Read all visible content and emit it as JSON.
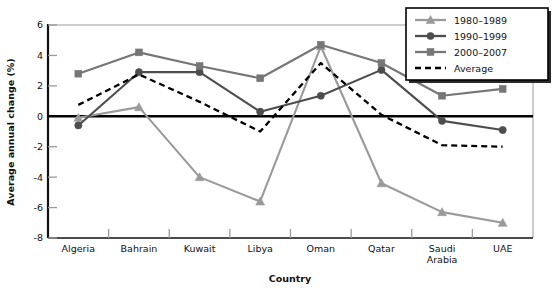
{
  "chart_data": {
    "type": "line",
    "title": "",
    "xlabel": "Country",
    "ylabel": "Average annual change (%)",
    "categories": [
      "Algeria",
      "Bahrain",
      "Kuwait",
      "Libya",
      "Oman",
      "Qatar",
      "Saudi Arabia",
      "UAE"
    ],
    "category_labels_multiline": [
      [
        "Algeria"
      ],
      [
        "Bahrain"
      ],
      [
        "Kuwait"
      ],
      [
        "Libya"
      ],
      [
        "Oman"
      ],
      [
        "Qatar"
      ],
      [
        "Saudi",
        "Arabia"
      ],
      [
        "UAE"
      ]
    ],
    "ylim": [
      -8,
      6
    ],
    "yticks": [
      6,
      4,
      2,
      0,
      -2,
      -4,
      -6,
      -8
    ],
    "ytick_labels": [
      "6",
      "4",
      "2",
      "0",
      "-2",
      "-4",
      "-6",
      "-8"
    ],
    "grid": false,
    "zero_line": true,
    "legend_position": "top-right",
    "series": [
      {
        "name": "1980-1989",
        "label": "1980–1989",
        "marker": "triangle",
        "color": "#9a9a9a",
        "dash": false,
        "values": [
          -0.1,
          0.6,
          -4.0,
          -5.6,
          4.6,
          -4.4,
          -6.3,
          -7.0
        ]
      },
      {
        "name": "1990-1999",
        "label": "1990–1999",
        "marker": "circle",
        "color": "#4d4d4d",
        "dash": false,
        "values": [
          -0.6,
          2.9,
          2.9,
          0.3,
          1.35,
          3.05,
          -0.3,
          -0.9
        ]
      },
      {
        "name": "2000-2007",
        "label": "2000–2007",
        "marker": "square",
        "color": "#767676",
        "dash": false,
        "values": [
          2.8,
          4.2,
          3.3,
          2.5,
          4.7,
          3.5,
          1.35,
          1.8
        ]
      },
      {
        "name": "Average",
        "label": "Average",
        "marker": "none",
        "color": "#000000",
        "dash": true,
        "values": [
          0.75,
          2.75,
          0.95,
          -1.0,
          3.5,
          0.1,
          -1.9,
          -2.0
        ]
      }
    ]
  },
  "legend": {
    "items": [
      {
        "label": "1980–1989"
      },
      {
        "label": "1990–1999"
      },
      {
        "label": "2000–2007"
      },
      {
        "label": "Average"
      }
    ]
  },
  "axes": {
    "y_title": "Average annual change (%)",
    "x_title": "Country",
    "y_ticks": [
      "6",
      "4",
      "2",
      "0",
      "-2",
      "-4",
      "-6",
      "-8"
    ],
    "x_categories": [
      "Algeria",
      "Bahrain",
      "Kuwait",
      "Libya",
      "Oman",
      "Qatar",
      "Saudi",
      "UAE"
    ],
    "x_category_second_line": [
      "",
      "",
      "",
      "",
      "",
      "",
      "Arabia",
      ""
    ]
  },
  "colors": {
    "series_1980": "#9a9a9a",
    "series_1990": "#4d4d4d",
    "series_2000": "#767676",
    "series_average": "#000000",
    "axis": "#111111",
    "frame": "#8f8f8f",
    "background": "#ffffff"
  }
}
